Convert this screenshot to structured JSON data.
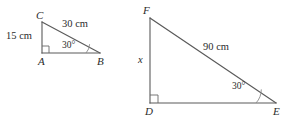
{
  "figure": {
    "ink_color": "#5a5a5a",
    "text_color": "#2b2b2b",
    "background": "#ffffff"
  },
  "triangle_left": {
    "name": "triangle-abc",
    "vertices": {
      "c_label": "C",
      "a_label": "A",
      "b_label": "B"
    },
    "measures": {
      "leg_vertical": "15 cm",
      "hypotenuse": "30 cm",
      "angle_at_b": "30°"
    },
    "right_angle_at": "A"
  },
  "triangle_right": {
    "name": "triangle-def",
    "vertices": {
      "f_label": "F",
      "d_label": "D",
      "e_label": "E"
    },
    "measures": {
      "leg_vertical": "x",
      "hypotenuse": "90 cm",
      "angle_at_e": "30°"
    },
    "right_angle_at": "D"
  }
}
